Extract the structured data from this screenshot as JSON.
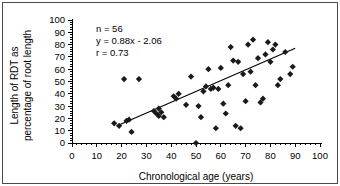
{
  "chart_data": {
    "type": "scatter",
    "title": "",
    "xlabel": "Chronological age (years)",
    "ylabel": "Length of RDT as percentage of root length",
    "xlim": [
      0,
      100
    ],
    "ylim": [
      0,
      100
    ],
    "xticks": [
      0,
      10,
      20,
      30,
      40,
      50,
      60,
      70,
      80,
      90,
      100
    ],
    "yticks": [
      0,
      10,
      20,
      30,
      40,
      50,
      60,
      70,
      80,
      90,
      100
    ],
    "x_minor_tick_interval": 2,
    "y_minor_tick_interval": 2,
    "grid": false,
    "legend": "none",
    "marker": "diamond",
    "marker_color": "#1a1a1a",
    "annotations": [
      "n = 56",
      "y = 0.88x - 2.06",
      "r = 0.73"
    ],
    "stats": {
      "n": 56,
      "equation": "y = 0.88x - 2.06",
      "slope": 0.88,
      "intercept": -2.06,
      "r": 0.73
    },
    "fit_line": {
      "type": "linear",
      "x_start": 18,
      "x_end": 90,
      "y_start": 13.8,
      "y_end": 77.1
    },
    "points": [
      {
        "x": 17,
        "y": 16
      },
      {
        "x": 19,
        "y": 14
      },
      {
        "x": 21,
        "y": 52
      },
      {
        "x": 22,
        "y": 18
      },
      {
        "x": 23,
        "y": 19
      },
      {
        "x": 24,
        "y": 9
      },
      {
        "x": 27,
        "y": 52
      },
      {
        "x": 33,
        "y": 26
      },
      {
        "x": 34,
        "y": 24
      },
      {
        "x": 35,
        "y": 22
      },
      {
        "x": 35,
        "y": 28
      },
      {
        "x": 36,
        "y": 25
      },
      {
        "x": 37,
        "y": 21
      },
      {
        "x": 41,
        "y": 38
      },
      {
        "x": 42,
        "y": 36
      },
      {
        "x": 43,
        "y": 40
      },
      {
        "x": 46,
        "y": 31
      },
      {
        "x": 48,
        "y": 54
      },
      {
        "x": 50,
        "y": 0
      },
      {
        "x": 51,
        "y": 30
      },
      {
        "x": 52,
        "y": 21
      },
      {
        "x": 53,
        "y": 42
      },
      {
        "x": 54,
        "y": 46
      },
      {
        "x": 55,
        "y": 60
      },
      {
        "x": 56,
        "y": 44
      },
      {
        "x": 57,
        "y": 45
      },
      {
        "x": 58,
        "y": 12
      },
      {
        "x": 59,
        "y": 44
      },
      {
        "x": 60,
        "y": 61
      },
      {
        "x": 61,
        "y": 32
      },
      {
        "x": 62,
        "y": 24
      },
      {
        "x": 63,
        "y": 47
      },
      {
        "x": 64,
        "y": 78
      },
      {
        "x": 65,
        "y": 67
      },
      {
        "x": 66,
        "y": 14
      },
      {
        "x": 67,
        "y": 66
      },
      {
        "x": 68,
        "y": 12
      },
      {
        "x": 69,
        "y": 56
      },
      {
        "x": 70,
        "y": 34
      },
      {
        "x": 71,
        "y": 80
      },
      {
        "x": 72,
        "y": 58
      },
      {
        "x": 73,
        "y": 84
      },
      {
        "x": 74,
        "y": 47
      },
      {
        "x": 75,
        "y": 69
      },
      {
        "x": 76,
        "y": 33
      },
      {
        "x": 77,
        "y": 36
      },
      {
        "x": 78,
        "y": 72
      },
      {
        "x": 79,
        "y": 82
      },
      {
        "x": 80,
        "y": 66
      },
      {
        "x": 81,
        "y": 76
      },
      {
        "x": 82,
        "y": 80
      },
      {
        "x": 83,
        "y": 47
      },
      {
        "x": 84,
        "y": 52
      },
      {
        "x": 86,
        "y": 74
      },
      {
        "x": 88,
        "y": 56
      },
      {
        "x": 89,
        "y": 62
      }
    ]
  }
}
